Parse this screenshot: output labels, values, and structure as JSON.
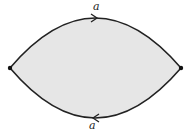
{
  "diagram": {
    "fill_color": "#e6e6e6",
    "stroke_color": "#222222",
    "vertices": [
      {
        "id": "left",
        "x": 10,
        "y": 68
      },
      {
        "id": "right",
        "x": 181,
        "y": 68
      }
    ],
    "edges": [
      {
        "id": "top",
        "label": "a",
        "direction": "left-to-right"
      },
      {
        "id": "bottom",
        "label": "a",
        "direction": "right-to-left"
      }
    ]
  }
}
